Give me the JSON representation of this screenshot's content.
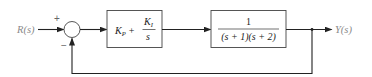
{
  "diagram": {
    "type": "feedback-control-block-diagram",
    "input": {
      "label": "R(s)"
    },
    "output": {
      "label": "Y(s)"
    },
    "summing_junction": {
      "plus_sign": "+",
      "minus_sign": "−"
    },
    "controller": {
      "kp_main": "K",
      "kp_sub": "P",
      "plus": "+",
      "ki_main": "K",
      "ki_sub": "I",
      "ki_den": "s"
    },
    "plant": {
      "numerator": "1",
      "denominator": "(s + 1)(s + 2)"
    },
    "feedback": {
      "type": "unity-negative"
    },
    "colors": {
      "line": "#222222",
      "label": "#8a8a8a"
    }
  }
}
